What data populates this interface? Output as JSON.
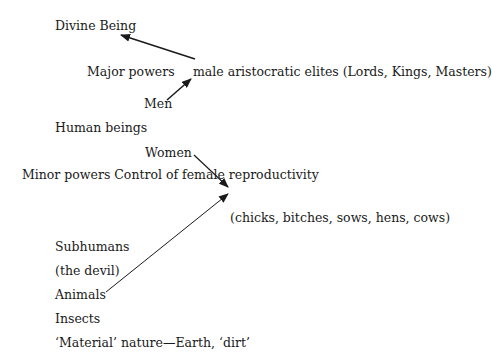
{
  "diagram": {
    "labels": {
      "divine_being": "Divine Being",
      "major_powers": "Major powers",
      "male_elites": "male aristocratic elites (Lords, Kings, Masters)",
      "men": "Men",
      "human_beings": "Human beings",
      "women": "Women",
      "minor_powers": "Minor powers Control of female reproductivity",
      "animal_terms": "(chicks, bitches, sows, hens, cows)",
      "subhumans": "Subhumans",
      "the_devil": "(the devil)",
      "animals": "Animals",
      "insects": "Insects",
      "material_nature": "‘Material’ nature—Earth, ‘dirt’"
    },
    "arrows": [
      {
        "from": "male aristocratic elites",
        "to": "Divine Being"
      },
      {
        "from": "Men",
        "to": "male aristocratic elites"
      },
      {
        "from": "Women",
        "to": "(chicks, bitches, sows, hens, cows)"
      },
      {
        "from": "Animals",
        "to": "(chicks, bitches, sows, hens, cows)"
      }
    ],
    "colors": {
      "text": "#1a1a1a",
      "arrow": "#1a1a1a",
      "background": "#ffffff"
    }
  }
}
